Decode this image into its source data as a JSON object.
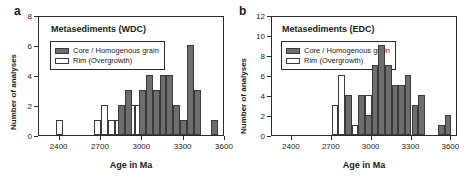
{
  "figure": {
    "axis_title_x": "Age in Ma",
    "axis_title_y": "Number of analyses",
    "legend": {
      "core_label": "Core / Homogenous grain",
      "rim_label": "Rim (Overgrowth)",
      "core_color": "#6e6e6e",
      "rim_color": "#ffffff",
      "outline_color": "#3a3a3a"
    }
  },
  "panels": [
    {
      "letter": "a",
      "title": "Metasediments (WDC)",
      "chart_data": {
        "type": "bar",
        "title": "Metasediments (WDC)",
        "xlabel": "Age in Ma",
        "ylabel": "Number of analyses",
        "xlim": [
          2250,
          3600
        ],
        "ylim": [
          0,
          8
        ],
        "xticks": [
          2400,
          2700,
          3000,
          3300,
          3600
        ],
        "yticks": [
          0,
          2,
          4,
          6,
          8
        ],
        "bin_width": 50,
        "grid": false,
        "legend_position": "upper-left-inside",
        "series": [
          {
            "name": "Rim (Overgrowth)",
            "color": "#ffffff",
            "bins": [
              {
                "x": 2375,
                "value": 1
              },
              {
                "x": 2650,
                "value": 1
              },
              {
                "x": 2700,
                "value": 2
              },
              {
                "x": 2750,
                "value": 1
              },
              {
                "x": 2800,
                "value": 1
              },
              {
                "x": 2850,
                "value": 1
              },
              {
                "x": 2900,
                "value": 2
              },
              {
                "x": 2950,
                "value": 2
              },
              {
                "x": 3000,
                "value": 1
              }
            ]
          },
          {
            "name": "Core / Homogenous grain",
            "color": "#6e6e6e",
            "bins": [
              {
                "x": 2825,
                "value": 2
              },
              {
                "x": 2875,
                "value": 3
              },
              {
                "x": 2975,
                "value": 3
              },
              {
                "x": 3025,
                "value": 4
              },
              {
                "x": 3075,
                "value": 3
              },
              {
                "x": 3125,
                "value": 4
              },
              {
                "x": 3175,
                "value": 4
              },
              {
                "x": 3225,
                "value": 2
              },
              {
                "x": 3275,
                "value": 1
              },
              {
                "x": 3325,
                "value": 6
              },
              {
                "x": 3375,
                "value": 3
              },
              {
                "x": 3500,
                "value": 1
              }
            ]
          }
        ]
      }
    },
    {
      "letter": "b",
      "title": "Metasediments (EDC)",
      "chart_data": {
        "type": "bar",
        "title": "Metasediments (EDC)",
        "xlabel": "Age in Ma",
        "ylabel": "Number of analyses",
        "xlim": [
          2250,
          3650
        ],
        "ylim": [
          0,
          12
        ],
        "xticks": [
          2400,
          2700,
          3000,
          3300,
          3600
        ],
        "yticks": [
          0,
          2,
          4,
          6,
          8,
          10,
          12
        ],
        "bin_width": 50,
        "grid": false,
        "legend_position": "upper-left-inside",
        "series": [
          {
            "name": "Rim (Overgrowth)",
            "color": "#ffffff",
            "bins": [
              {
                "x": 2700,
                "value": 3
              },
              {
                "x": 2750,
                "value": 6
              },
              {
                "x": 2800,
                "value": 2
              },
              {
                "x": 2850,
                "value": 1
              },
              {
                "x": 2900,
                "value": 2
              },
              {
                "x": 2950,
                "value": 4
              },
              {
                "x": 3000,
                "value": 1
              }
            ]
          },
          {
            "name": "Core / Homogenous grain",
            "color": "#6e6e6e",
            "bins": [
              {
                "x": 2800,
                "value": 4
              },
              {
                "x": 2900,
                "value": 4
              },
              {
                "x": 2950,
                "value": 2
              },
              {
                "x": 3000,
                "value": 7
              },
              {
                "x": 3050,
                "value": 9
              },
              {
                "x": 3100,
                "value": 7
              },
              {
                "x": 3150,
                "value": 5
              },
              {
                "x": 3200,
                "value": 5
              },
              {
                "x": 3250,
                "value": 6
              },
              {
                "x": 3300,
                "value": 3
              },
              {
                "x": 3350,
                "value": 4
              },
              {
                "x": 3500,
                "value": 1
              },
              {
                "x": 3550,
                "value": 2
              }
            ]
          }
        ]
      }
    }
  ]
}
